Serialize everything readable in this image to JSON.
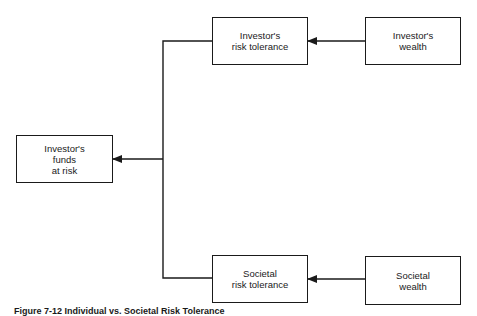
{
  "diagram": {
    "nodes": {
      "investor_risk_tolerance": {
        "lines": [
          "Investor's",
          "risk tolerance"
        ]
      },
      "investor_wealth": {
        "lines": [
          "Investor's",
          "wealth"
        ]
      },
      "investor_funds_at_risk": {
        "lines": [
          "Investor's",
          "funds",
          "at risk"
        ]
      },
      "societal_risk_tolerance": {
        "lines": [
          "Societal",
          "risk tolerance"
        ]
      },
      "societal_wealth": {
        "lines": [
          "Societal",
          "wealth"
        ]
      }
    },
    "edges": [
      {
        "from": "investor_wealth",
        "to": "investor_risk_tolerance"
      },
      {
        "from": "societal_wealth",
        "to": "societal_risk_tolerance"
      },
      {
        "from": "investor_risk_tolerance",
        "to": "investor_funds_at_risk"
      },
      {
        "from": "societal_risk_tolerance",
        "to": "investor_funds_at_risk"
      }
    ],
    "caption": "Figure 7-12  Individual vs. Societal Risk Tolerance"
  }
}
